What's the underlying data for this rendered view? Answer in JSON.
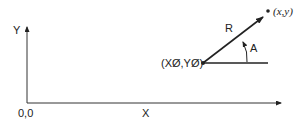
{
  "diagram": {
    "type": "polar-coordinate-diagram",
    "axes": {
      "x_label": "X",
      "y_label": "Y",
      "origin_label": "0,0"
    },
    "reference_point": {
      "label": "(XØ,YØ)"
    },
    "target_point": {
      "label": "(x,y)"
    },
    "radius_label": "R",
    "angle_label": "A",
    "colors": {
      "line": "#222222",
      "background": "#ffffff"
    }
  }
}
